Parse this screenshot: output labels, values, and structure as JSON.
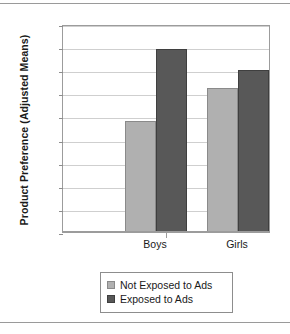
{
  "chart_data": {
    "type": "bar",
    "title": "",
    "xlabel": "",
    "ylabel": "Product Preference (Adjusted Means)",
    "categories": [
      "Boys",
      "Girls"
    ],
    "series": [
      {
        "name": "Not Exposed to Ads",
        "color": "#b0b0b0",
        "values": [
          0.96,
          1.25
        ]
      },
      {
        "name": "Exposed to Ads",
        "color": "#585858",
        "values": [
          1.58,
          1.4
        ]
      }
    ],
    "ylim": [
      0,
      1.8
    ],
    "ytick_labels": [
      "1.8",
      "1.6",
      "1.4",
      "1.2",
      "1",
      "0.8",
      "0.6",
      "0.4",
      "0.2",
      "0"
    ],
    "ytick_values": [
      1.8,
      1.6,
      1.4,
      1.2,
      1.0,
      0.8,
      0.6,
      0.4,
      0.2,
      0
    ],
    "grid": "horizontal",
    "legend_position": "bottom"
  },
  "axis": {
    "y_title": "Product Preference (Adjusted Means)"
  },
  "legend": {
    "entries": [
      {
        "label": "Not Exposed to Ads",
        "swatch": "light"
      },
      {
        "label": "Exposed to Ads",
        "swatch": "dark"
      }
    ]
  }
}
